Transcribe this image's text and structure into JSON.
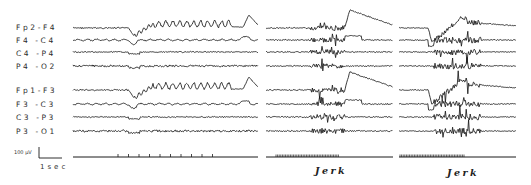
{
  "figure": {
    "channels_right": [
      "Fp2-F4",
      "F4 -C4",
      "C4 -P4",
      "P4 -O2"
    ],
    "channels_left": [
      "Fp1-F3",
      "F3 -C3",
      "C3 -P3",
      "P3 -O1"
    ],
    "scale_voltage": "100 µV",
    "scale_time": "1sec",
    "event_label_1": "Jerk",
    "event_label_2": "Jerk",
    "trace_color": "#1a1a1a"
  },
  "chart_data": {
    "type": "line",
    "title": "",
    "channels": [
      "Fp2-F4",
      "F4-C4",
      "C4-P4",
      "P4-O2",
      "Fp1-F3",
      "F3-C3",
      "C3-P3",
      "P3-O1"
    ],
    "channel_baselines_px": [
      28,
      40,
      52,
      66,
      90,
      104,
      117,
      131
    ],
    "panels": [
      {
        "name": "panel-1",
        "x_start": 73,
        "x_end": 258,
        "event": "",
        "time_marks": 10
      },
      {
        "name": "panel-2",
        "x_start": 266,
        "x_end": 393,
        "event": "Jerk",
        "marker_x": [
          276,
          340
        ]
      },
      {
        "name": "panel-3",
        "x_start": 399,
        "x_end": 516,
        "event": "Jerk",
        "marker_x": [
          400,
          465
        ]
      }
    ],
    "scale_bar": {
      "voltage": "100 µV",
      "time": "1 sec"
    },
    "xlabel": "",
    "ylabel": "",
    "grid": false
  }
}
